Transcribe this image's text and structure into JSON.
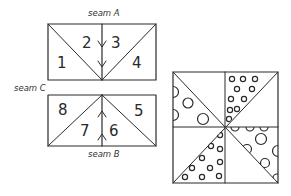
{
  "labels": {
    "seam_a": "seam A",
    "seam_b": "seam B",
    "seam_c": "seam C"
  },
  "top_unit": {
    "pieces": [
      "1",
      "2",
      "3",
      "4"
    ]
  },
  "bottom_unit": {
    "pieces": [
      "8",
      "7",
      "6",
      "5"
    ]
  },
  "finished_block": {
    "description": "Pinwheel quilt block with four polka-dot patterned triangles",
    "quadrants": [
      "top-left",
      "top-right",
      "bottom-left",
      "bottom-right"
    ]
  },
  "colors": {
    "line": "#2a2a2a",
    "background": "#ffffff"
  }
}
